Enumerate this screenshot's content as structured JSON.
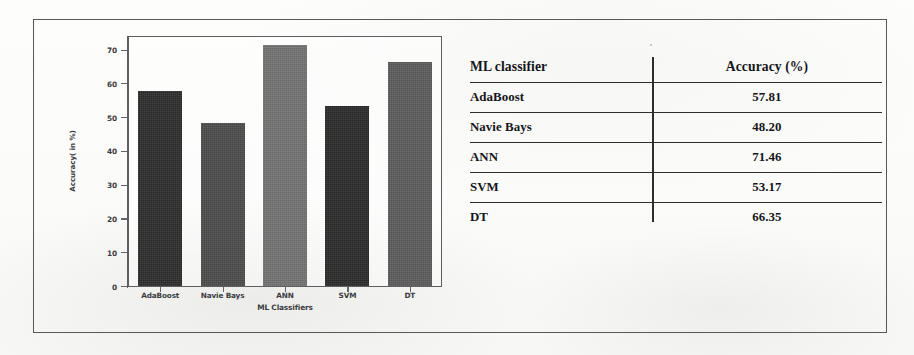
{
  "figure": {
    "background_color": "#fbfbfa",
    "frame_color": "#56575a"
  },
  "chart_data": {
    "type": "bar",
    "title": "",
    "xlabel": "ML Classifiers",
    "ylabel": "Accuracy( in %)",
    "categories": [
      "AdaBoost",
      "Navie Bays",
      "ANN",
      "SVM",
      "DT"
    ],
    "values": [
      57.81,
      48.2,
      71.46,
      53.17,
      66.35
    ],
    "bar_colors": [
      "#2d2d2d",
      "#4c4c4c",
      "#737373",
      "#2b2b2b",
      "#5c5c5c"
    ],
    "ylim": [
      0,
      74
    ],
    "yticks": [
      0,
      10,
      20,
      30,
      40,
      50,
      60,
      70
    ],
    "ytick_labels": [
      "0",
      "10",
      "20",
      "30",
      "40",
      "50",
      "60",
      "70"
    ],
    "grid": false,
    "legend": false
  },
  "table": {
    "headers": [
      "ML classifier",
      "Accuracy (%)"
    ],
    "rows": [
      {
        "classifier": "AdaBoost",
        "accuracy": "57.81"
      },
      {
        "classifier": "Navie Bays",
        "accuracy": "48.20"
      },
      {
        "classifier": "ANN",
        "accuracy": "71.46"
      },
      {
        "classifier": "SVM",
        "accuracy": "53.17"
      },
      {
        "classifier": "DT",
        "accuracy": "66.35"
      }
    ]
  }
}
